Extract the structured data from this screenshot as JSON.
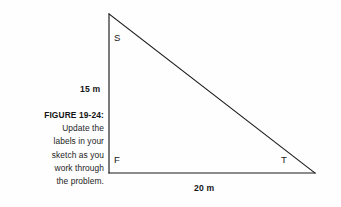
{
  "figure": {
    "caption": {
      "head": "FIGURE 19-24:",
      "lines": [
        "Update the",
        "labels in your",
        "sketch as you",
        "work through",
        "the problem."
      ]
    },
    "diagram": {
      "type": "right-triangle",
      "stroke_color": "#1a1a1a",
      "background_color": "#fefefe",
      "vertices": [
        {
          "name": "S",
          "label": "S",
          "x": 109,
          "y": 14,
          "role": "apex-top-left"
        },
        {
          "name": "F",
          "label": "F",
          "x": 109,
          "y": 173,
          "role": "right-angle-bottom-left"
        },
        {
          "name": "T",
          "label": "T",
          "x": 315,
          "y": 173,
          "role": "bottom-right"
        }
      ],
      "sides": [
        {
          "name": "SF",
          "label": "15 m",
          "orientation": "vertical",
          "length_value": 15,
          "unit": "m"
        },
        {
          "name": "FT",
          "label": "20 m",
          "orientation": "horizontal",
          "length_value": 20,
          "unit": "m"
        },
        {
          "name": "ST",
          "label": "",
          "orientation": "hypotenuse",
          "length_value": 25,
          "unit": "m"
        }
      ]
    }
  }
}
